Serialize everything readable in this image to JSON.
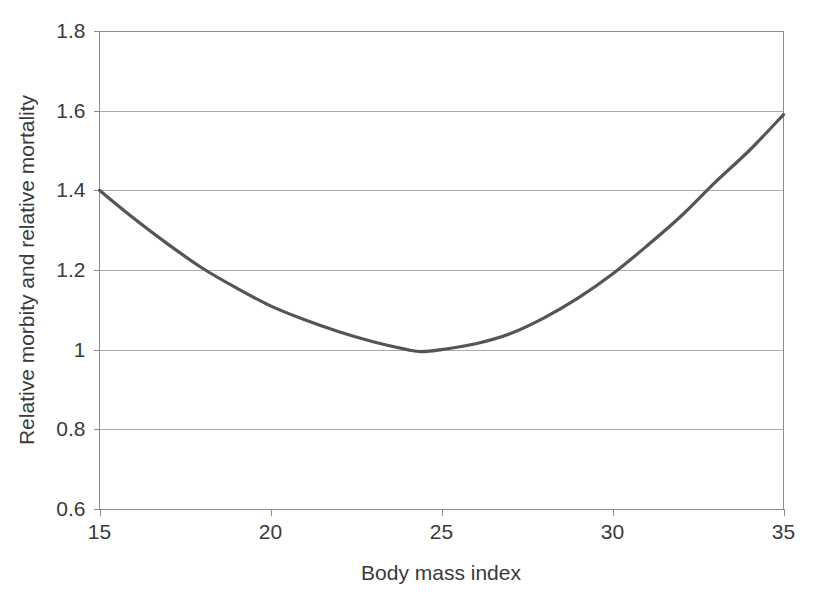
{
  "chart_data": {
    "type": "line",
    "title": "",
    "subtitle": "",
    "xlabel": "Body mass index",
    "ylabel": "Relative morbity and relative mortality",
    "xlim": [
      15,
      35
    ],
    "ylim": [
      0.6,
      1.8
    ],
    "x_ticks": [
      15,
      20,
      25,
      30,
      35
    ],
    "x_tick_labels": [
      "15",
      "20",
      "25",
      "30",
      "35"
    ],
    "y_ticks": [
      0.6,
      0.8,
      1,
      1.2,
      1.4,
      1.6,
      1.8
    ],
    "y_tick_labels": [
      "0.6",
      "0.8",
      "1",
      "1.2",
      "1.4",
      "1.6",
      "1.8"
    ],
    "grid": {
      "horizontal": true,
      "vertical": false
    },
    "legend": {
      "visible": false,
      "position": "none"
    },
    "annotations": [],
    "series": [
      {
        "name": "Relative morbity and relative mortality",
        "color": "#555555",
        "line_width": 3.2,
        "markers": false,
        "x": [
          15,
          16,
          17,
          18,
          19,
          20,
          21,
          22,
          23,
          24,
          24.4,
          25,
          26,
          27,
          28,
          29,
          30,
          31,
          32,
          33,
          34,
          35
        ],
        "values": [
          1.4,
          1.33,
          1.265,
          1.205,
          1.155,
          1.11,
          1.075,
          1.045,
          1.02,
          1.0,
          0.995,
          1.0,
          1.015,
          1.04,
          1.08,
          1.13,
          1.19,
          1.26,
          1.335,
          1.42,
          1.5,
          1.59
        ]
      }
    ]
  },
  "axis_titles": {
    "x": "Body mass index",
    "y": "Relative morbity and relative mortality"
  },
  "colors": {
    "series_line": "#555555",
    "gridline": "#a9a9a9",
    "axis": "#8c8c8c",
    "text": "#3a3a3a",
    "background": "#ffffff"
  }
}
